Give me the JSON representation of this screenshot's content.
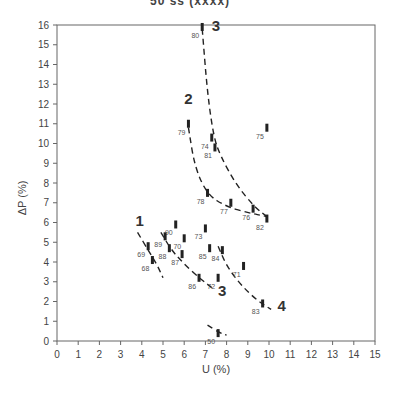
{
  "chart_data": {
    "type": "scatter",
    "title": "",
    "title_clipped_fragment": "50 ss (xxxx)",
    "xlabel": "U (%)",
    "ylabel": "ΔP (%)",
    "xlim": [
      0,
      15
    ],
    "ylim": [
      0,
      16
    ],
    "xticks": [
      0,
      1,
      2,
      3,
      4,
      5,
      6,
      7,
      8,
      9,
      10,
      11,
      12,
      13,
      14,
      15
    ],
    "yticks": [
      0,
      1,
      2,
      3,
      4,
      5,
      6,
      7,
      8,
      9,
      10,
      11,
      12,
      13,
      14,
      15,
      16
    ],
    "grid": false,
    "legend": null,
    "points": [
      {
        "label": "80",
        "x": 6.85,
        "y": 15.9
      },
      {
        "label": "79",
        "x": 6.2,
        "y": 11.0
      },
      {
        "label": "74",
        "x": 7.3,
        "y": 10.3
      },
      {
        "label": "81",
        "x": 7.45,
        "y": 9.8
      },
      {
        "label": "75",
        "x": 9.9,
        "y": 10.8
      },
      {
        "label": "78",
        "x": 7.1,
        "y": 7.5
      },
      {
        "label": "77",
        "x": 8.2,
        "y": 7.0
      },
      {
        "label": "76",
        "x": 9.25,
        "y": 6.7
      },
      {
        "label": "82",
        "x": 9.9,
        "y": 6.2
      },
      {
        "label": "90",
        "x": 5.6,
        "y": 5.9
      },
      {
        "label": "89",
        "x": 5.1,
        "y": 5.3
      },
      {
        "label": "70",
        "x": 6.0,
        "y": 5.2
      },
      {
        "label": "88",
        "x": 5.3,
        "y": 4.7
      },
      {
        "label": "87",
        "x": 5.9,
        "y": 4.4
      },
      {
        "label": "73",
        "x": 7.0,
        "y": 5.7
      },
      {
        "label": "85",
        "x": 7.2,
        "y": 4.7
      },
      {
        "label": "84",
        "x": 7.8,
        "y": 4.6
      },
      {
        "label": "71",
        "x": 8.8,
        "y": 3.8
      },
      {
        "label": "86",
        "x": 6.7,
        "y": 3.2
      },
      {
        "label": "72",
        "x": 7.6,
        "y": 3.2
      },
      {
        "label": "83",
        "x": 9.7,
        "y": 1.9
      },
      {
        "label": "69",
        "x": 4.3,
        "y": 4.8
      },
      {
        "label": "68",
        "x": 4.5,
        "y": 4.1
      },
      {
        "label": "50",
        "x": 7.6,
        "y": 0.4
      }
    ],
    "curves": [
      {
        "name": "1",
        "style": "dashed",
        "points": [
          [
            3.8,
            5.5
          ],
          [
            4.3,
            4.6
          ],
          [
            4.7,
            3.9
          ],
          [
            5.0,
            3.2
          ]
        ]
      },
      {
        "name": "2",
        "style": "dashed",
        "points": [
          [
            6.2,
            10.8
          ],
          [
            6.5,
            8.8
          ],
          [
            7.1,
            7.4
          ],
          [
            8.0,
            6.8
          ],
          [
            9.0,
            6.5
          ],
          [
            9.9,
            6.3
          ]
        ]
      },
      {
        "name": "3 (upper)",
        "style": "dashed",
        "points": [
          [
            6.85,
            15.8
          ],
          [
            7.1,
            12.5
          ],
          [
            7.4,
            10.3
          ],
          [
            7.7,
            9.4
          ],
          [
            8.4,
            8.0
          ],
          [
            9.3,
            6.8
          ],
          [
            9.9,
            6.3
          ]
        ]
      },
      {
        "name": "3 (lower)",
        "style": "dashed",
        "points": [
          [
            4.9,
            5.5
          ],
          [
            5.4,
            4.6
          ],
          [
            6.0,
            3.9
          ],
          [
            6.7,
            3.2
          ],
          [
            7.3,
            2.7
          ]
        ]
      },
      {
        "name": "4",
        "style": "dashed",
        "points": [
          [
            7.6,
            4.8
          ],
          [
            8.0,
            3.8
          ],
          [
            8.7,
            2.8
          ],
          [
            9.5,
            2.0
          ],
          [
            10.1,
            1.6
          ]
        ]
      },
      {
        "name": "50",
        "style": "dashed",
        "points": [
          [
            7.1,
            0.8
          ],
          [
            7.7,
            0.4
          ],
          [
            8.0,
            0.3
          ]
        ]
      }
    ],
    "annotations": [
      {
        "text": "1",
        "x": 3.7,
        "y": 5.8
      },
      {
        "text": "2",
        "x": 6.0,
        "y": 12.0
      },
      {
        "text": "3",
        "x": 7.3,
        "y": 15.7
      },
      {
        "text": "3",
        "x": 7.6,
        "y": 2.3
      },
      {
        "text": "4",
        "x": 10.4,
        "y": 1.5
      }
    ]
  },
  "axes": {
    "xlabel": "U (%)",
    "ylabel": "ΔP (%)"
  }
}
